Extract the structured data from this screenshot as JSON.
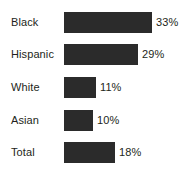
{
  "chart_data": {
    "type": "bar",
    "orientation": "horizontal",
    "title": "",
    "subtitle": "",
    "xlabel": "",
    "ylabel": "",
    "grid": false,
    "legend": null,
    "axis_visible": false,
    "value_suffix": "%",
    "xlim": [
      0,
      35
    ],
    "categories": [
      "Black",
      "Hispanic",
      "White",
      "Asian",
      "Total"
    ],
    "values": [
      33,
      29,
      11,
      10,
      18
    ],
    "value_labels": [
      "33%",
      "29%",
      "11%",
      "10%",
      "18%"
    ],
    "bar_color": "#2b2b2b",
    "text_color": "#231f20",
    "background_color": "#ffffff",
    "bars": [
      {
        "label": "Black",
        "value": 33,
        "value_label": "33%",
        "pixel_width": 88,
        "row_top": 6
      },
      {
        "label": "Hispanic",
        "value": 29,
        "value_label": "29%",
        "pixel_width": 74,
        "row_top": 38
      },
      {
        "label": "White",
        "value": 11,
        "value_label": "11%",
        "pixel_width": 32,
        "row_top": 71
      },
      {
        "label": "Asian",
        "value": 10,
        "value_label": "10%",
        "pixel_width": 29,
        "row_top": 104
      },
      {
        "label": "Total",
        "value": 18,
        "value_label": "18%",
        "pixel_width": 51,
        "row_top": 136
      }
    ]
  }
}
